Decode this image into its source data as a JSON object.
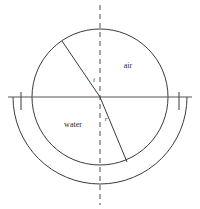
{
  "diagram": {
    "canvas": {
      "width": 200,
      "height": 209,
      "background": "#ffffff"
    },
    "colors": {
      "stroke": "#3a3a3a",
      "interface_stroke": "#555555",
      "normal_stroke": "#6b6b6b",
      "ray_stroke": "#3a3a3a",
      "text": "#2b2b2b"
    },
    "labels": {
      "air": "air",
      "water": "water",
      "incident_angle": "i",
      "refracted_angle": "r"
    },
    "geometry": {
      "center": {
        "x": 100,
        "y": 97
      },
      "circle_radius": 68,
      "outer_arc_radius": 87,
      "interface_line": {
        "x1": 8,
        "y1": 97,
        "x2": 192,
        "y2": 97
      },
      "normal_line": {
        "x1": 100,
        "y1": 5,
        "x2": 100,
        "y2": 205
      },
      "incident_ray": {
        "x1": 62,
        "y1": 41,
        "x2": 100,
        "y2": 97
      },
      "refracted_ray": {
        "x1": 100,
        "y1": 97,
        "x2": 127,
        "y2": 162
      },
      "left_tick": {
        "x": 21,
        "y1": 92,
        "y2": 110
      },
      "right_tick": {
        "x": 179,
        "y1": 92,
        "y2": 110
      }
    },
    "label_positions": {
      "air": {
        "x": 128,
        "y": 68
      },
      "water": {
        "x": 73,
        "y": 127
      },
      "incident_angle": {
        "x": 94,
        "y": 82
      },
      "refracted_angle": {
        "x": 106,
        "y": 121
      }
    }
  }
}
